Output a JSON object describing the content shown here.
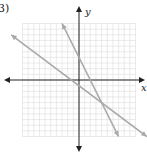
{
  "problem": {
    "label": "3)"
  },
  "chart_data": {
    "type": "line",
    "title": "",
    "xlabel": "x",
    "ylabel": "y",
    "xlim": [
      -10,
      10
    ],
    "ylim": [
      -10,
      10
    ],
    "grid": true,
    "series": [
      {
        "name": "line-1",
        "equation": "y = -2x + 4",
        "points": [
          [
            -3,
            10
          ],
          [
            7,
            -10
          ]
        ]
      },
      {
        "name": "line-2",
        "equation": "y = -0.75x - 1",
        "points": [
          [
            -12,
            8
          ],
          [
            12,
            -10
          ]
        ]
      }
    ],
    "intersection": [
      4,
      -4
    ],
    "colors": {
      "grid": "#dcdcdc",
      "axis": "#222222",
      "line": "#a8a8a8"
    }
  }
}
